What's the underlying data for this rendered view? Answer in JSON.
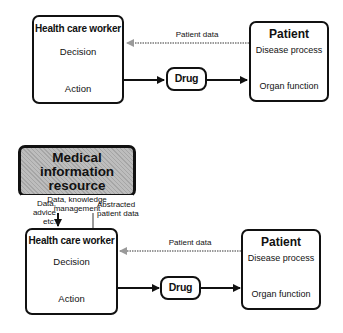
{
  "top_diagram": {
    "health_care_worker": {
      "title": "Health care worker",
      "decision": "Decision",
      "action": "Action"
    },
    "patient": {
      "title": "Patient",
      "disease_process": "Disease process",
      "organ_function": "Organ function"
    },
    "drug": {
      "label": "Drug"
    },
    "patient_data_label": "Patient data"
  },
  "bottom_diagram": {
    "medical_information_resource": {
      "title_line1": "Medical information",
      "title_line2": "resource",
      "note": "Data, knowledge management"
    },
    "down_arrow_label": {
      "line1": "Data,",
      "line2": "advice",
      "line3": "etc."
    },
    "up_arrow_label": {
      "line1": "Abstracted",
      "line2": "patient data"
    },
    "health_care_worker": {
      "title": "Health care worker",
      "decision": "Decision",
      "action": "Action"
    },
    "patient": {
      "title": "Patient",
      "disease_process": "Disease process",
      "organ_function": "Organ function"
    },
    "drug": {
      "label": "Drug"
    },
    "patient_data_label": "Patient data"
  },
  "colors": {
    "line": "#111111",
    "feedback_arrow": "#9a9a9a",
    "resource_fill": "#bdbdbd"
  }
}
